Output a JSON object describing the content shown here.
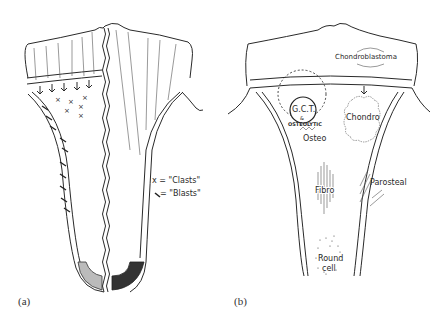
{
  "figure": {
    "panels": [
      {
        "id": "a",
        "label": "(a)",
        "legend": [
          {
            "symbol": "x-mark",
            "text": "x = \"Clasts\""
          },
          {
            "symbol": "arrow",
            "text": "= \"Blasts\""
          }
        ]
      },
      {
        "id": "b",
        "label": "(b)",
        "annotations": [
          {
            "text": "Chondroblastoma"
          },
          {
            "text": "G.C.T."
          },
          {
            "text": "&"
          },
          {
            "text": "OSTEOLYTIC"
          },
          {
            "text": "Osteo"
          },
          {
            "text": "Chondro"
          },
          {
            "text": "Fibro"
          },
          {
            "text": "Parosteal"
          },
          {
            "text": "Round"
          },
          {
            "text": "cell"
          }
        ]
      }
    ]
  }
}
